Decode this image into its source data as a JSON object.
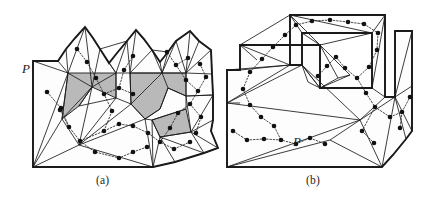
{
  "figure": {
    "background_color": "#ffffff",
    "stroke_color": "#1a1a1a",
    "shade_color": "#b9b9b9",
    "dot_color": "#111111",
    "dual_edge_color": "#333333",
    "page_bleed_text": "",
    "captions": [
      {
        "id": "a",
        "label": "(a)"
      },
      {
        "id": "b",
        "label": "(b)"
      }
    ],
    "panels": [
      {
        "id": "a",
        "caption": "(a)",
        "polygon_label": "P",
        "polygon_label_pos": {
          "x": 22,
          "y": 73
        },
        "description": "Simple polygon P with a triangulation, its dual tree drawn with dotted edges and solid round nodes, and several triangles shaded gray.",
        "boundary": [
          [
            33,
            61
          ],
          [
            33,
            160
          ],
          [
            33,
            167
          ],
          [
            153,
            167
          ],
          [
            175,
            162
          ],
          [
            204,
            153
          ],
          [
            218,
            148
          ],
          [
            211,
            131
          ],
          [
            213,
            120
          ],
          [
            213,
            95
          ],
          [
            212,
            74
          ],
          [
            211,
            50
          ],
          [
            199,
            41
          ],
          [
            190,
            31
          ],
          [
            176,
            41
          ],
          [
            168,
            52
          ],
          [
            160,
            62
          ],
          [
            152,
            50
          ],
          [
            144,
            39
          ],
          [
            136,
            30
          ],
          [
            127,
            41
          ],
          [
            117,
            53
          ],
          [
            109,
            63
          ],
          [
            100,
            49
          ],
          [
            93,
            38
          ],
          [
            85,
            27
          ],
          [
            75,
            38
          ],
          [
            66,
            49
          ],
          [
            58,
            61
          ]
        ],
        "shaded_regions": [
          [
            [
              68,
              73
            ],
            [
              116,
              73
            ],
            [
              116,
              97
            ],
            [
              92,
              87
            ],
            [
              79,
              105
            ],
            [
              62,
              118
            ]
          ],
          [
            [
              130,
              73
            ],
            [
              162,
              73
            ],
            [
              186,
              73
            ],
            [
              186,
              95
            ],
            [
              168,
              88
            ],
            [
              160,
              108
            ],
            [
              145,
              118
            ],
            [
              131,
              103
            ]
          ],
          [
            [
              152,
              118
            ],
            [
              186,
              108
            ],
            [
              190,
              131
            ],
            [
              160,
              135
            ]
          ]
        ]
      },
      {
        "id": "b",
        "caption": "(b)",
        "polygon_label": "P",
        "polygon_label_pos": {
          "x": 293,
          "y": 146
        },
        "description": "Spiral-shaped simple polygon P with a triangulation, its dual tree drawn with dotted edges and solid round nodes. No shaded triangles.",
        "boundary": [
          [
            227,
            154
          ],
          [
            227,
            167
          ],
          [
            382,
            167
          ],
          [
            393,
            155
          ],
          [
            400,
            147
          ],
          [
            406,
            139
          ],
          [
            412,
            131
          ],
          [
            412,
            86
          ],
          [
            412,
            31
          ],
          [
            395,
            31
          ],
          [
            395,
            96
          ],
          [
            389,
            99
          ],
          [
            385,
            94
          ],
          [
            385,
            15
          ],
          [
            290,
            15
          ],
          [
            290,
            65
          ],
          [
            302,
            65
          ],
          [
            302,
            33
          ],
          [
            372,
            33
          ],
          [
            372,
            88
          ],
          [
            320,
            88
          ],
          [
            320,
            45
          ],
          [
            240,
            45
          ],
          [
            240,
            70
          ],
          [
            227,
            70
          ],
          [
            227,
            100
          ],
          [
            240,
            103
          ]
        ],
        "shaded_regions": []
      }
    ],
    "legend_note": "Black dots mark dual-graph nodes; dotted polylines connect adjacent triangles."
  }
}
